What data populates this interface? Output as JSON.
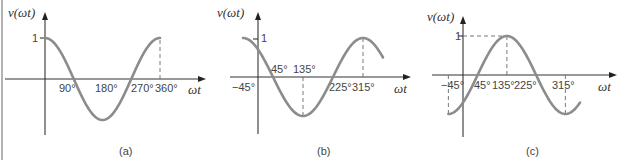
{
  "chart_data": [
    {
      "type": "line",
      "panel": "(a)",
      "caption": "(a)",
      "function": "cos(ωt)",
      "phase_deg": 0,
      "amplitude": 1,
      "ylabel": "v(ωt)",
      "xlabel": "ωt",
      "y_tick_labels": [
        "1"
      ],
      "x_tick_labels": [
        "90°",
        "180°",
        "270°",
        "360°"
      ],
      "x_ticks_deg": [
        90,
        180,
        270,
        360
      ],
      "x_range_deg": [
        0,
        360
      ],
      "dashed_guides": [
        {
          "type": "vertical",
          "x_deg": 360,
          "from_y": 0,
          "to_y": 1
        }
      ],
      "series": [
        {
          "name": "v(ωt)",
          "x_deg": [
            0,
            45,
            90,
            135,
            180,
            225,
            270,
            315,
            360
          ],
          "values": [
            1,
            0.707,
            0,
            -0.707,
            -1,
            -0.707,
            0,
            0.707,
            1
          ]
        }
      ]
    },
    {
      "type": "line",
      "panel": "(b)",
      "caption": "(b)",
      "function": "cos(ωt + 45°)",
      "phase_deg": 45,
      "amplitude": 1,
      "ylabel": "v(ωt)",
      "xlabel": "ωt",
      "y_tick_labels": [
        "1"
      ],
      "x_tick_labels": [
        "−45°",
        "45°",
        "135°",
        "225°",
        "315°"
      ],
      "x_ticks_deg": [
        -45,
        45,
        135,
        225,
        315
      ],
      "x_range_deg": [
        -45,
        375
      ],
      "dashed_guides": [
        {
          "type": "vertical",
          "x_deg": 135,
          "from_y": 0,
          "to_y": -1
        },
        {
          "type": "vertical",
          "x_deg": 315,
          "from_y": 0,
          "to_y": 1
        }
      ],
      "series": [
        {
          "name": "v(ωt)",
          "x_deg": [
            -45,
            0,
            45,
            135,
            225,
            315,
            360
          ],
          "values": [
            1,
            0.707,
            0,
            -1,
            0,
            1,
            0.707
          ]
        }
      ]
    },
    {
      "type": "line",
      "panel": "(c)",
      "caption": "(c)",
      "function": "cos(ωt − 135°)",
      "phase_deg": -135,
      "amplitude": 1,
      "ylabel": "v(ωt)",
      "xlabel": "ωt",
      "y_tick_labels": [
        "1"
      ],
      "x_tick_labels": [
        "−45°",
        "45°",
        "135°",
        "225°",
        "315°"
      ],
      "x_ticks_deg": [
        -45,
        45,
        135,
        225,
        315
      ],
      "x_range_deg": [
        -45,
        360
      ],
      "dashed_guides": [
        {
          "type": "horizontal",
          "y": 1,
          "from_x_deg": 0,
          "to_x_deg": 135
        },
        {
          "type": "vertical",
          "x_deg": 135,
          "from_y": 0,
          "to_y": 1
        },
        {
          "type": "vertical",
          "x_deg": -45,
          "from_y": 0,
          "to_y": -1
        },
        {
          "type": "vertical",
          "x_deg": 315,
          "from_y": 0,
          "to_y": -1
        }
      ],
      "series": [
        {
          "name": "v(ωt)",
          "x_deg": [
            -45,
            0,
            45,
            135,
            225,
            315,
            360
          ],
          "values": [
            -1,
            -0.707,
            0,
            1,
            0,
            -1,
            -0.707
          ]
        }
      ]
    }
  ]
}
